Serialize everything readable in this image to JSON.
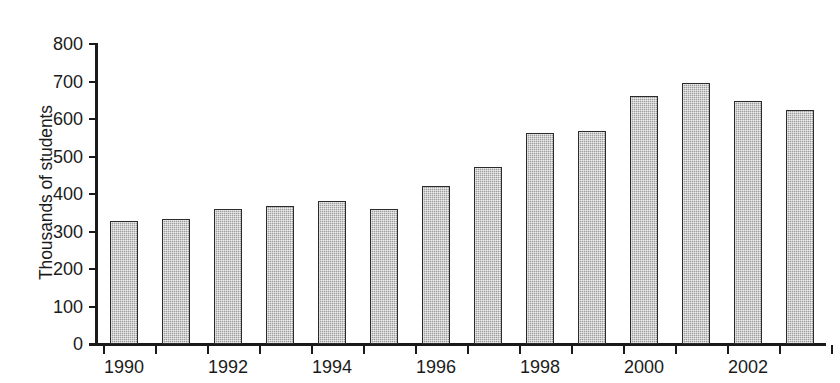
{
  "chart_data": {
    "type": "bar",
    "title": "",
    "xlabel": "",
    "ylabel": "Thousands of students",
    "ylim": [
      0,
      800
    ],
    "ytick_values": [
      800,
      700,
      600,
      500,
      400,
      300,
      200,
      100,
      0
    ],
    "ytick_labels": [
      "800",
      "700",
      "600",
      "500",
      "400",
      "300",
      "200",
      "100",
      "0"
    ],
    "xtick_labels": [
      "1990",
      "1992",
      "1994",
      "1996",
      "1998",
      "2000",
      "2002"
    ],
    "grid": false,
    "legend": null,
    "categories": [
      "1990",
      "1991",
      "1992",
      "1993",
      "1994",
      "1995",
      "1996",
      "1997",
      "1998",
      "1999",
      "2000",
      "2001",
      "2002",
      "2003"
    ],
    "values": [
      328,
      334,
      360,
      369,
      381,
      361,
      421,
      472,
      564,
      569,
      662,
      696,
      648,
      624
    ],
    "bar_color": "#9d9d9d",
    "bar_edge_color": "#2b2b2b",
    "axis_color": "#1a1a1a",
    "background_color": "#ffffff"
  },
  "caption": {
    "cropped_text": ""
  }
}
